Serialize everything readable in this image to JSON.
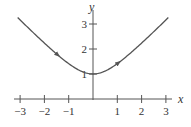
{
  "chart_data": {
    "type": "line",
    "title": "",
    "xlabel": "x",
    "ylabel": "y",
    "xlim": [
      -3,
      3
    ],
    "ylim": [
      0,
      3.2
    ],
    "xticks": [
      -3,
      -2,
      -1,
      1,
      2,
      3
    ],
    "xtick_labels": [
      "−3",
      "−2",
      "−1",
      "1",
      "2",
      "3"
    ],
    "yticks": [
      1,
      2,
      3
    ],
    "ytick_labels": [
      "1",
      "2",
      "3"
    ],
    "grid": false,
    "legend": null,
    "series": [
      {
        "name": "curve",
        "equation": "y = sqrt(1 + x^2)",
        "x": [
          -3,
          -2.5,
          -2,
          -1.5,
          -1,
          -0.5,
          0,
          0.5,
          1,
          1.5,
          2,
          2.5,
          3
        ],
        "y": [
          3.16,
          2.69,
          2.24,
          1.8,
          1.41,
          1.12,
          1.0,
          1.12,
          1.41,
          1.8,
          2.24,
          2.69,
          3.16
        ],
        "direction_arrows_at_x": [
          -1.5,
          1
        ],
        "direction": "increasing x"
      }
    ],
    "colors": {
      "curve": "#555555",
      "axes": "#555555",
      "text": "#333333"
    }
  }
}
